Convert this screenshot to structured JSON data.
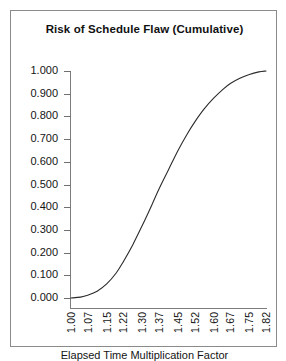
{
  "chart_data": {
    "type": "line",
    "title": "Risk of Schedule Flaw (Cumulative)",
    "xlabel": "Elapsed Time Multiplication Factor",
    "ylabel": "",
    "xlim": [
      1.0,
      1.82
    ],
    "ylim": [
      0.0,
      1.0
    ],
    "grid": false,
    "legend": null,
    "x_tick_labels": [
      "1.00",
      "1.07",
      "1.15",
      "1.22",
      "1.30",
      "1.37",
      "1.45",
      "1.52",
      "1.60",
      "1.67",
      "1.75",
      "1.82"
    ],
    "x_tick_values": [
      1.0,
      1.07,
      1.15,
      1.22,
      1.3,
      1.37,
      1.45,
      1.52,
      1.6,
      1.67,
      1.75,
      1.82
    ],
    "y_tick_labels": [
      "1.000",
      "0.900",
      "0.800",
      "0.700",
      "0.600",
      "0.500",
      "0.400",
      "0.300",
      "0.200",
      "0.100",
      "0.000"
    ],
    "y_tick_values": [
      1.0,
      0.9,
      0.8,
      0.7,
      0.6,
      0.5,
      0.4,
      0.3,
      0.2,
      0.1,
      0.0
    ],
    "series": [
      {
        "name": "Cumulative risk of schedule flaw",
        "color": "#2b2b2b",
        "x": [
          1.0,
          1.04,
          1.07,
          1.11,
          1.15,
          1.19,
          1.22,
          1.26,
          1.3,
          1.34,
          1.37,
          1.41,
          1.45,
          1.49,
          1.52,
          1.56,
          1.6,
          1.64,
          1.67,
          1.71,
          1.75,
          1.79,
          1.82
        ],
        "values": [
          0.0,
          0.004,
          0.012,
          0.03,
          0.062,
          0.11,
          0.16,
          0.235,
          0.32,
          0.41,
          0.48,
          0.565,
          0.65,
          0.725,
          0.775,
          0.833,
          0.88,
          0.92,
          0.945,
          0.968,
          0.985,
          0.996,
          1.0
        ]
      }
    ]
  },
  "figure": {
    "title": "Risk of Schedule Flaw (Cumulative)",
    "x_axis_title": "Elapsed Time Multiplication Factor"
  }
}
